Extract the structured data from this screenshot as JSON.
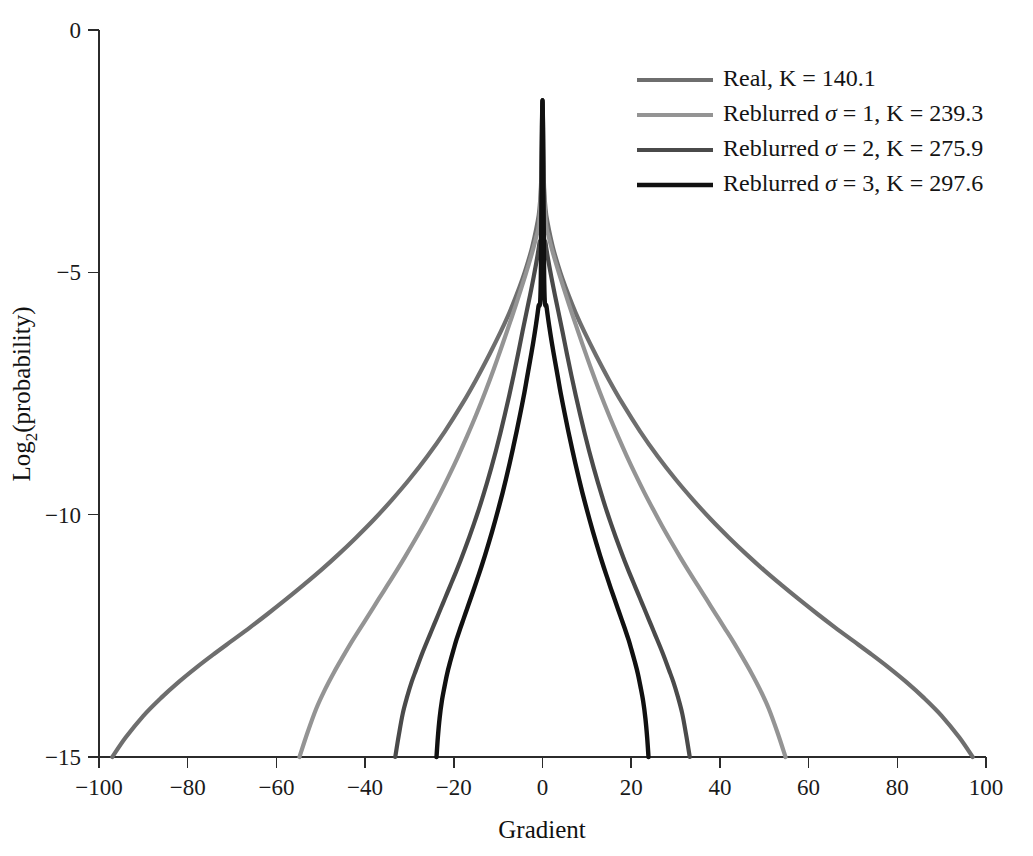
{
  "chart_data": {
    "type": "line",
    "title": "",
    "xlabel": "Gradient",
    "ylabel": "Log2(probability)",
    "ylabel_base": "Log",
    "ylabel_sub": "2",
    "ylabel_rest": "(probability)",
    "xlim": [
      -100,
      100
    ],
    "ylim": [
      -15,
      0
    ],
    "xticks": [
      -100,
      -80,
      -60,
      -40,
      -20,
      0,
      20,
      40,
      60,
      80,
      100
    ],
    "xtick_labels": [
      "−100",
      "−80",
      "−60",
      "−40",
      "−20",
      "0",
      "20",
      "40",
      "60",
      "80",
      "100"
    ],
    "yticks": [
      0,
      -5,
      -10,
      -15
    ],
    "ytick_labels": [
      "0",
      "−5",
      "−10",
      "−15"
    ],
    "grid": false,
    "legend_position": "top-right",
    "peak_value": -1.45,
    "series": [
      {
        "name": "Real, K = 140.1",
        "label_prefix": "Real, K = ",
        "label_value": "140.1",
        "has_sigma": false,
        "sigma": null,
        "K": 140.1,
        "color": "#6e6e6e",
        "width": 4.2,
        "x": [
          -97.0,
          -94.0,
          -90.0,
          -86.0,
          -82.0,
          -78.0,
          -74.0,
          -70.0,
          -66.0,
          -62.0,
          -58.0,
          -54.0,
          -50.0,
          -46.0,
          -42.0,
          -38.0,
          -34.0,
          -30.0,
          -26.0,
          -22.0,
          -18.0,
          -15.0,
          -12.0,
          -9.5,
          -7.5,
          -6.0,
          -4.5,
          -3.5,
          -2.5,
          -1.8,
          -1.2,
          -0.7,
          -0.3,
          0.0,
          0.3,
          0.7,
          1.2,
          1.8,
          2.5,
          3.5,
          4.5,
          6.0,
          7.5,
          9.5,
          12.0,
          15.0,
          18.0,
          22.0,
          26.0,
          30.0,
          34.0,
          38.0,
          42.0,
          46.0,
          50.0,
          54.0,
          58.0,
          62.0,
          66.0,
          70.0,
          74.0,
          78.0,
          82.0,
          86.0,
          90.0,
          94.0,
          97.0
        ],
        "y": [
          -15.0,
          -14.6,
          -14.15,
          -13.78,
          -13.45,
          -13.15,
          -12.87,
          -12.6,
          -12.33,
          -12.05,
          -11.76,
          -11.46,
          -11.15,
          -10.82,
          -10.47,
          -10.1,
          -9.7,
          -9.27,
          -8.8,
          -8.28,
          -7.7,
          -7.22,
          -6.7,
          -6.24,
          -5.84,
          -5.5,
          -5.13,
          -4.85,
          -4.54,
          -4.27,
          -4.0,
          -3.7,
          -3.1,
          -1.45,
          -3.1,
          -3.7,
          -4.0,
          -4.27,
          -4.54,
          -4.85,
          -5.13,
          -5.5,
          -5.84,
          -6.24,
          -6.7,
          -7.22,
          -7.7,
          -8.28,
          -8.8,
          -9.27,
          -9.7,
          -10.1,
          -10.47,
          -10.82,
          -11.15,
          -11.46,
          -11.76,
          -12.05,
          -12.33,
          -12.6,
          -12.87,
          -13.15,
          -13.45,
          -13.78,
          -14.15,
          -14.6,
          -15.0
        ]
      },
      {
        "name": "Reblurred σ = 1, K = 239.3",
        "label_prefix": "Reblurred ",
        "label_mid": " = 1, K = ",
        "label_value": "239.3",
        "has_sigma": true,
        "sigma": 1,
        "K": 239.3,
        "color": "#949494",
        "width": 4.2,
        "x": [
          -54.8,
          -53.0,
          -51.0,
          -49.0,
          -47.0,
          -45.0,
          -43.0,
          -41.0,
          -39.0,
          -37.0,
          -35.0,
          -33.0,
          -31.0,
          -29.0,
          -27.0,
          -25.0,
          -23.0,
          -21.0,
          -19.0,
          -17.0,
          -15.0,
          -13.0,
          -11.0,
          -9.0,
          -7.5,
          -6.0,
          -4.8,
          -3.8,
          -2.8,
          -2.0,
          -1.4,
          -0.8,
          -0.3,
          0.0,
          0.3,
          0.8,
          1.4,
          2.0,
          2.8,
          3.8,
          4.8,
          6.0,
          7.5,
          9.0,
          11.0,
          13.0,
          15.0,
          17.0,
          19.0,
          21.0,
          23.0,
          25.0,
          27.0,
          29.0,
          31.0,
          33.0,
          35.0,
          37.0,
          39.0,
          41.0,
          43.0,
          45.0,
          47.0,
          49.0,
          51.0,
          53.0,
          54.8
        ],
        "y": [
          -15.0,
          -14.5,
          -14.0,
          -13.6,
          -13.25,
          -12.93,
          -12.62,
          -12.33,
          -12.04,
          -11.75,
          -11.46,
          -11.17,
          -10.87,
          -10.56,
          -10.24,
          -9.9,
          -9.55,
          -9.18,
          -8.79,
          -8.38,
          -7.95,
          -7.49,
          -7.0,
          -6.48,
          -6.08,
          -5.67,
          -5.33,
          -5.04,
          -4.74,
          -4.48,
          -4.26,
          -4.0,
          -3.2,
          -1.45,
          -3.2,
          -4.0,
          -4.26,
          -4.48,
          -4.74,
          -5.04,
          -5.33,
          -5.67,
          -6.08,
          -6.48,
          -7.0,
          -7.49,
          -7.95,
          -8.38,
          -8.79,
          -9.18,
          -9.55,
          -9.9,
          -10.24,
          -10.56,
          -10.87,
          -11.17,
          -11.46,
          -11.75,
          -12.04,
          -12.33,
          -12.62,
          -12.93,
          -13.25,
          -13.6,
          -14.0,
          -14.5,
          -15.0
        ]
      },
      {
        "name": "Reblurred σ = 2, K = 275.9",
        "label_prefix": "Reblurred ",
        "label_mid": " = 2, K = ",
        "label_value": "275.9",
        "has_sigma": true,
        "sigma": 2,
        "K": 275.9,
        "color": "#4a4a4a",
        "width": 4.2,
        "x": [
          -33.2,
          -32.4,
          -31.5,
          -30.5,
          -29.5,
          -28.5,
          -27.5,
          -26.5,
          -25.5,
          -24.5,
          -23.5,
          -22.5,
          -21.5,
          -20.5,
          -19.5,
          -18.5,
          -17.5,
          -16.5,
          -15.5,
          -14.5,
          -13.5,
          -12.5,
          -11.5,
          -10.5,
          -9.5,
          -8.5,
          -7.5,
          -6.5,
          -5.5,
          -4.5,
          -3.6,
          -2.8,
          -2.0,
          -1.3,
          -0.7,
          -0.25,
          0.0,
          0.25,
          0.7,
          1.3,
          2.0,
          2.8,
          3.6,
          4.5,
          5.5,
          6.5,
          7.5,
          8.5,
          9.5,
          10.5,
          11.5,
          12.5,
          13.5,
          14.5,
          15.5,
          16.5,
          17.5,
          18.5,
          19.5,
          20.5,
          21.5,
          22.5,
          23.5,
          24.5,
          25.5,
          26.5,
          27.5,
          28.5,
          29.5,
          30.5,
          31.5,
          32.4,
          33.2
        ],
        "y": [
          -15.0,
          -14.55,
          -14.1,
          -13.75,
          -13.45,
          -13.2,
          -12.95,
          -12.72,
          -12.5,
          -12.28,
          -12.06,
          -11.84,
          -11.62,
          -11.4,
          -11.18,
          -10.95,
          -10.71,
          -10.46,
          -10.2,
          -9.93,
          -9.64,
          -9.34,
          -9.02,
          -8.68,
          -8.32,
          -7.94,
          -7.54,
          -7.12,
          -6.68,
          -6.22,
          -5.82,
          -5.47,
          -5.1,
          -4.75,
          -4.4,
          -4.0,
          -1.45,
          -4.0,
          -4.4,
          -4.75,
          -5.1,
          -5.47,
          -5.82,
          -6.22,
          -6.68,
          -7.12,
          -7.54,
          -7.94,
          -8.32,
          -8.68,
          -9.02,
          -9.34,
          -9.64,
          -9.93,
          -10.2,
          -10.46,
          -10.71,
          -10.95,
          -11.18,
          -11.4,
          -11.62,
          -11.84,
          -12.06,
          -12.28,
          -12.5,
          -12.72,
          -12.95,
          -13.2,
          -13.45,
          -13.75,
          -14.1,
          -14.55,
          -15.0
        ]
      },
      {
        "name": "Reblurred σ = 3, K = 297.6",
        "label_prefix": "Reblurred ",
        "label_mid": " = 3, K = ",
        "label_value": "297.6",
        "has_sigma": true,
        "sigma": 3,
        "K": 297.6,
        "color": "#111111",
        "width": 4.4,
        "x": [
          -23.9,
          -23.6,
          -23.2,
          -22.7,
          -22.1,
          -21.5,
          -20.8,
          -20.1,
          -19.4,
          -18.6,
          -17.8,
          -17.0,
          -16.2,
          -15.4,
          -14.6,
          -13.8,
          -13.0,
          -12.2,
          -11.4,
          -10.6,
          -9.8,
          -9.0,
          -8.2,
          -7.4,
          -6.6,
          -5.8,
          -5.0,
          -4.2,
          -3.5,
          -2.8,
          -2.1,
          -1.5,
          -0.9,
          -0.4,
          0.0,
          0.4,
          0.9,
          1.5,
          2.1,
          2.8,
          3.5,
          4.2,
          5.0,
          5.8,
          6.6,
          7.4,
          8.2,
          9.0,
          9.8,
          10.6,
          11.4,
          12.2,
          13.0,
          13.8,
          14.6,
          15.4,
          16.2,
          17.0,
          17.8,
          18.6,
          19.4,
          20.1,
          20.8,
          21.5,
          22.1,
          22.7,
          23.2,
          23.6,
          23.9
        ],
        "y": [
          -15.0,
          -14.6,
          -14.2,
          -13.85,
          -13.55,
          -13.28,
          -13.03,
          -12.8,
          -12.58,
          -12.36,
          -12.15,
          -11.94,
          -11.73,
          -11.52,
          -11.3,
          -11.08,
          -10.85,
          -10.61,
          -10.36,
          -10.1,
          -9.83,
          -9.55,
          -9.25,
          -8.94,
          -8.61,
          -8.27,
          -7.91,
          -7.54,
          -7.18,
          -6.82,
          -6.45,
          -6.1,
          -5.7,
          -5.25,
          -1.45,
          -5.25,
          -5.7,
          -6.1,
          -6.45,
          -6.82,
          -7.18,
          -7.54,
          -7.91,
          -8.27,
          -8.61,
          -8.94,
          -9.25,
          -9.55,
          -9.83,
          -10.1,
          -10.36,
          -10.61,
          -10.85,
          -11.08,
          -11.3,
          -11.52,
          -11.73,
          -11.94,
          -12.15,
          -12.36,
          -12.58,
          -12.8,
          -13.03,
          -13.28,
          -13.55,
          -13.85,
          -14.2,
          -14.6,
          -15.0
        ]
      }
    ]
  },
  "legend": {
    "sigma_symbol": "σ",
    "items": [
      {
        "text": "Real, K = 140.1",
        "color": "#6e6e6e"
      },
      {
        "text": "Reblurred σ = 1, K = 239.3",
        "color": "#949494"
      },
      {
        "text": "Reblurred σ = 2, K = 275.9",
        "color": "#4a4a4a"
      },
      {
        "text": "Reblurred σ = 3, K = 297.6",
        "color": "#111111"
      }
    ]
  }
}
